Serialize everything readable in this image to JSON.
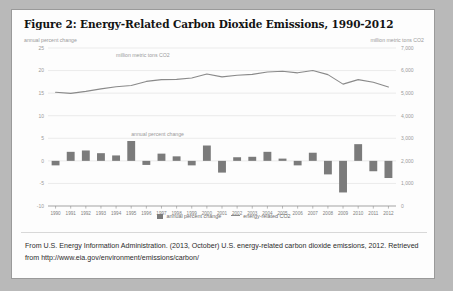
{
  "figure": {
    "title": "Figure 2: Energy-Related Carbon Dioxide Emissions, 1990-2012",
    "left_axis_label": "annual percent change",
    "right_axis_label": "million metric tons CO2",
    "source_line1": "From U.S. Energy Information Administration. (2013, October) U.S. energy-related carbon dioxide emissions,",
    "source_line2": "2012. Retrieved from http://www.eia.gov/environment/emissions/carbon/"
  },
  "legend": {
    "bar_label": "annual percent change",
    "line_label": "energy-related CO2"
  },
  "annotations": {
    "line_series_note": "million metric tons CO2",
    "bar_series_note": "annual percent change"
  },
  "colors": {
    "page_background": "#b9b9b9",
    "card_background": "#fdfdfd",
    "card_border": "#9a9a9a",
    "title_text": "#131313",
    "axis_text": "#9a9a9a",
    "gridline": "#e2e2e2",
    "bar_fill": "#7b7b7b",
    "line_stroke": "#8a8a8a",
    "source_text": "#2c2c2c"
  },
  "chart_data": {
    "type": "bar",
    "title": "Figure 2: Energy-Related Carbon Dioxide Emissions, 1990-2012",
    "xlabel": "",
    "ylabel": "annual percent change",
    "y2label": "million metric tons CO2",
    "grid": true,
    "legend_position": "bottom",
    "categories": [
      "1990",
      "1991",
      "1992",
      "1993",
      "1994",
      "1995",
      "1996",
      "1997",
      "1998",
      "1999",
      "2000",
      "2001",
      "2002",
      "2003",
      "2004",
      "2005",
      "2006",
      "2007",
      "2008",
      "2009",
      "2010",
      "2011",
      "2012"
    ],
    "ylim": [
      -10,
      25
    ],
    "yticks": [
      25,
      20,
      15,
      10,
      5,
      0,
      -5,
      -10
    ],
    "ytick_labels": [
      "25",
      "20",
      "15",
      "10",
      "5",
      "0",
      "-5",
      "-10"
    ],
    "y2lim": [
      0,
      7000
    ],
    "y2ticks": [
      0,
      1000,
      2000,
      3000,
      4000,
      5000,
      6000,
      7000
    ],
    "y2tick_labels": [
      "0",
      "1,000",
      "2,000",
      "3,000",
      "4,000",
      "5,000",
      "6,000",
      "7,000"
    ],
    "series": [
      {
        "name": "annual percent change",
        "type": "bar",
        "axis": "left",
        "values": [
          -1.0,
          2.0,
          2.3,
          1.7,
          1.2,
          4.4,
          -0.9,
          1.6,
          1.0,
          -1.0,
          3.4,
          -2.6,
          0.8,
          0.9,
          2.0,
          0.5,
          -1.0,
          1.8,
          -3.0,
          -7.0,
          3.7,
          -2.3,
          -3.8
        ]
      },
      {
        "name": "energy-related CO2",
        "type": "line",
        "axis": "right",
        "values": [
          5040,
          4990,
          5080,
          5190,
          5280,
          5340,
          5520,
          5600,
          5610,
          5670,
          5850,
          5720,
          5790,
          5830,
          5940,
          5970,
          5900,
          6000,
          5820,
          5400,
          5600,
          5480,
          5270
        ]
      }
    ]
  }
}
